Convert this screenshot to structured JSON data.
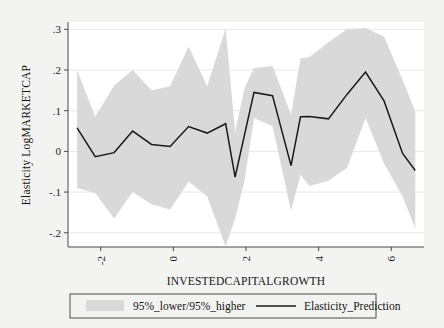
{
  "chart_data": {
    "type": "line",
    "title": "",
    "subtitle": "",
    "xlabel": "INVESTEDCAPITALGROWTH",
    "ylabel": "Elasticity LogMARKETCAP",
    "xlim": [
      -2.9,
      6.9
    ],
    "ylim": [
      -0.235,
      0.318
    ],
    "xticks": [
      -2,
      0,
      2,
      4,
      6
    ],
    "xticklabels": [
      "-2",
      "0",
      "2",
      "4",
      "6"
    ],
    "yticks": [
      -0.2,
      -0.1,
      0,
      0.1,
      0.2,
      0.3
    ],
    "yticklabels": [
      "-.2",
      "-.1",
      "0",
      ".1",
      ".2",
      ".3"
    ],
    "grid": "horizontal",
    "legend_position": "below",
    "x": [
      -2.65,
      -2.15,
      -1.63,
      -1.12,
      -0.6,
      -0.09,
      0.42,
      0.93,
      1.44,
      1.7,
      1.96,
      2.22,
      2.73,
      3.24,
      3.5,
      3.75,
      4.27,
      4.78,
      5.29,
      5.8,
      6.31,
      6.66
    ],
    "series": [
      {
        "name": "Elasticity_Prediction",
        "color": "#1a1a1a",
        "values": [
          0.058,
          -0.013,
          -0.003,
          0.05,
          0.017,
          0.012,
          0.061,
          0.045,
          0.068,
          -0.063,
          0.041,
          0.145,
          0.137,
          -0.035,
          0.085,
          0.086,
          0.08,
          0.14,
          0.195,
          0.124,
          -0.005,
          -0.047
        ]
      },
      {
        "name": "95%_higher",
        "color": "#d9d9d9",
        "values": [
          0.2,
          0.085,
          0.162,
          0.2,
          0.15,
          0.16,
          0.258,
          0.16,
          0.302,
          0.047,
          0.155,
          0.205,
          0.21,
          0.09,
          0.228,
          0.232,
          0.268,
          0.3,
          0.303,
          0.282,
          0.176,
          0.098
        ]
      },
      {
        "name": "95%_lower",
        "color": "#d9d9d9",
        "values": [
          -0.09,
          -0.102,
          -0.165,
          -0.1,
          -0.13,
          -0.143,
          -0.074,
          -0.11,
          -0.234,
          -0.165,
          -0.072,
          0.082,
          0.062,
          -0.145,
          -0.058,
          -0.085,
          -0.072,
          -0.04,
          0.082,
          -0.03,
          -0.11,
          -0.19
        ]
      }
    ],
    "legend_entries": [
      {
        "label": "95%_lower/95%_higher",
        "type": "band",
        "color": "#d9d9d9"
      },
      {
        "label": "Elasticity_Prediction",
        "type": "line",
        "color": "#1a1a1a"
      }
    ]
  },
  "axes": {
    "y_label": "Elasticity LogMARKETCAP",
    "x_label": "INVESTEDCAPITALGROWTH"
  },
  "colors": {
    "background": "#f3f3f1",
    "plot_background": "#ffffff",
    "band": "#d9d9d9",
    "line": "#1a1a1a",
    "axis": "#4a4a4a",
    "grid": "#e8e8e8",
    "text": "#141414"
  }
}
